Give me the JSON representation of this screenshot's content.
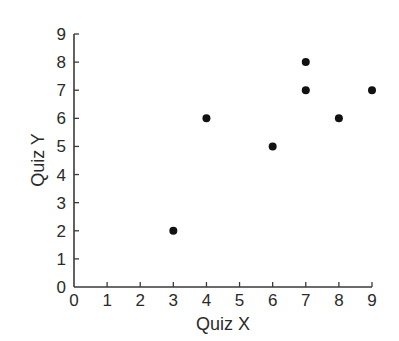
{
  "chart_data": {
    "type": "scatter",
    "title": "",
    "xlabel": "Quiz X",
    "ylabel": "Quiz Y",
    "xlim": [
      0,
      9
    ],
    "ylim": [
      0,
      9
    ],
    "x_ticks": [
      0,
      1,
      2,
      3,
      4,
      5,
      6,
      7,
      8,
      9
    ],
    "y_ticks": [
      0,
      1,
      2,
      3,
      4,
      5,
      6,
      7,
      8,
      9
    ],
    "grid": false,
    "legend": null,
    "series": [
      {
        "name": "points",
        "color": "#111111",
        "points": [
          {
            "x": 3,
            "y": 2
          },
          {
            "x": 4,
            "y": 6
          },
          {
            "x": 6,
            "y": 5
          },
          {
            "x": 7,
            "y": 8
          },
          {
            "x": 7,
            "y": 7
          },
          {
            "x": 8,
            "y": 6
          },
          {
            "x": 9,
            "y": 7
          }
        ]
      }
    ]
  },
  "colors": {
    "axis": "#3a3a3a",
    "text": "#2a2a2a",
    "marker": "#111111",
    "background": "#ffffff"
  }
}
